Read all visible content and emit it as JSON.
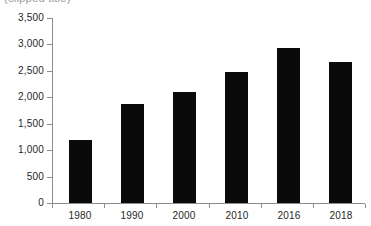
{
  "chart_data": {
    "type": "bar",
    "title": "",
    "subtitle": "",
    "xlabel": "",
    "ylabel": "",
    "categories": [
      "1980",
      "1990",
      "2000",
      "2010",
      "2016",
      "2018"
    ],
    "values": [
      1200,
      1870,
      2100,
      2480,
      2940,
      2670
    ],
    "ylim": [
      0,
      3500
    ],
    "ytick_step": 500,
    "ytick_labels": [
      "0",
      "500",
      "1,000",
      "1,500",
      "2,000",
      "2,500",
      "3,000",
      "3,500"
    ],
    "ytick_values": [
      0,
      500,
      1000,
      1500,
      2000,
      2500,
      3000,
      3500
    ],
    "grid": false,
    "legend": false,
    "legend_position": "none",
    "bar_color": "#0a0a0a",
    "axis_color": "#8d8d8d",
    "background": "#ffffff"
  },
  "title_strip": {
    "text": "(clipped title)"
  }
}
